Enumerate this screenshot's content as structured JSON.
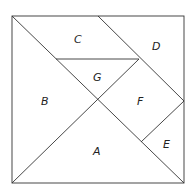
{
  "diagram": {
    "type": "tangram",
    "labels": {
      "A": "A",
      "B": "B",
      "C": "C",
      "D": "D",
      "E": "E",
      "F": "F",
      "G": "G"
    },
    "colors": {
      "line": "#333333",
      "background": "#ffffff",
      "text": "#222222"
    }
  }
}
